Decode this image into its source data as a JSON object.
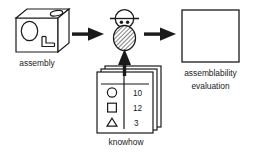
{
  "diagram": {
    "background_color": "#ffffff",
    "line_color": "#1a1a1a",
    "nodes": {
      "assembly": {
        "label": "assembly",
        "shape": "3d-box",
        "features": [
          "front-ellipse",
          "l-shaped-notch",
          "top-ellipse-hole"
        ]
      },
      "evaluator": {
        "label": "",
        "shape": "person-icon",
        "features": [
          "round-head",
          "hat-brim-line",
          "two-eyes",
          "hatched-oval-body"
        ]
      },
      "knowhow": {
        "label": "knowhow",
        "shape": "card-stack",
        "card_count": 3,
        "table": {
          "rows": [
            {
              "symbol": "circle",
              "value": "10"
            },
            {
              "symbol": "square",
              "value": "12"
            },
            {
              "symbol": "triangle",
              "value": "3"
            }
          ]
        }
      },
      "evaluation": {
        "label_line1": "assemblability",
        "label_line2": "evaluation",
        "shape": "empty-square"
      }
    },
    "arrows": [
      {
        "name": "assembly-to-evaluator",
        "direction": "right"
      },
      {
        "name": "evaluator-to-evaluation",
        "direction": "right"
      },
      {
        "name": "knowhow-to-evaluator",
        "direction": "up"
      }
    ]
  }
}
